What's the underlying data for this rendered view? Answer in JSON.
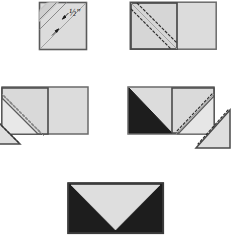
{
  "figure": {
    "caption": "",
    "colors": {
      "light_fabric": "#dcdcdc",
      "light_fabric_alt": "#d2d2d2",
      "dark_fabric": "#1d1d1d",
      "outline": "#555555",
      "outline_dark": "#3a3a3a",
      "stitch_line": "#4a4a4a",
      "band_fill": "#c9c9c9",
      "paper_background": "#ffffff"
    }
  },
  "steps": [
    {
      "id": "step-1",
      "name": "marked-square",
      "description": "Light square with diagonal band marked",
      "measurement_label": "½\"",
      "shape": "square",
      "markings": [
        "diagonal-band",
        "seam-allowance-arrows"
      ],
      "fabric": "light"
    },
    {
      "id": "step-2",
      "name": "square-on-rectangle",
      "description": "Square placed on left end of rectangle, stitched on both sides of marked line",
      "shape": "rectangle",
      "markings": [
        "dashed-stitch-line-upper",
        "dashed-stitch-line-lower"
      ],
      "fabric": "light"
    },
    {
      "id": "step-3",
      "name": "left-corner-folded-out",
      "description": "Left corner triangle pressed open, cut triangle falls away at lower left",
      "shape": "rectangle-with-left-flap",
      "markings": [
        "dashed-stitch-line-upper",
        "dashed-stitch-line-lower"
      ],
      "fabric": "light"
    },
    {
      "id": "step-4",
      "name": "right-square-added",
      "description": "Dark triangle sewn at left; second square stitched at right end, trimmed triangle to lower right",
      "shape": "rectangle-with-right-flap",
      "markings": [
        "dashed-stitch-line-upper",
        "dashed-stitch-line-lower"
      ],
      "fabric": "light-and-dark"
    },
    {
      "id": "step-5",
      "name": "finished-block",
      "description": "Completed envelope block: light centre triangle on dark ground",
      "shape": "rectangle",
      "markings": [],
      "fabric": "light-and-dark"
    }
  ]
}
